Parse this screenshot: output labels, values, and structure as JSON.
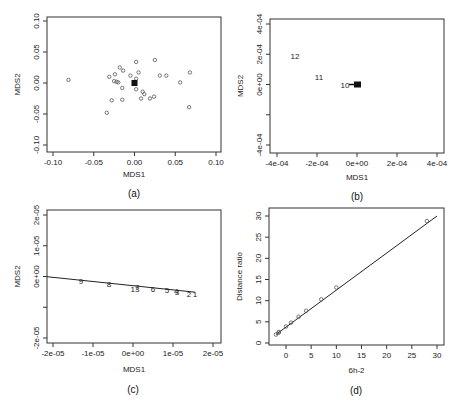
{
  "chart_data": [
    {
      "panel": "a",
      "type": "scatter",
      "caption": "(a)",
      "xlabel": "MDS1",
      "ylabel": "MDS2",
      "xlim": [
        -0.1,
        0.1
      ],
      "ylim": [
        -0.1,
        0.1
      ],
      "xticks": [
        "-0.10",
        "-0.05",
        "0.00",
        "0.05",
        "0.10"
      ],
      "yticks": [
        "-0.10",
        "-0.05",
        "0.00",
        "0.05",
        "0.10"
      ],
      "grid": false,
      "points": [
        [
          -0.081,
          0.005
        ],
        [
          -0.034,
          -0.048
        ],
        [
          -0.031,
          0.01
        ],
        [
          -0.028,
          -0.028
        ],
        [
          -0.025,
          0.003
        ],
        [
          -0.024,
          0.014
        ],
        [
          -0.022,
          0.002
        ],
        [
          -0.02,
          0.001
        ],
        [
          -0.018,
          0.025
        ],
        [
          -0.015,
          -0.008
        ],
        [
          -0.015,
          -0.027
        ],
        [
          -0.014,
          0.02
        ],
        [
          -0.005,
          0.012
        ],
        [
          0.002,
          0.034
        ],
        [
          0.002,
          0.007
        ],
        [
          0.002,
          -0.01
        ],
        [
          0.005,
          0.017
        ],
        [
          0.008,
          -0.025
        ],
        [
          0.01,
          -0.014
        ],
        [
          0.012,
          -0.018
        ],
        [
          0.019,
          -0.025
        ],
        [
          0.024,
          -0.022
        ],
        [
          0.025,
          0.037
        ],
        [
          0.031,
          0.012
        ],
        [
          0.039,
          0.012
        ],
        [
          0.056,
          0.001
        ],
        [
          0.068,
          0.017
        ],
        [
          0.067,
          -0.039
        ]
      ],
      "filled_cluster": [
        0.0,
        0.0
      ]
    },
    {
      "panel": "b",
      "type": "scatter",
      "caption": "(b)",
      "xlabel": "MDS1",
      "ylabel": "MDS2",
      "xlim": [
        -0.0004,
        0.0004
      ],
      "ylim": [
        -0.0004,
        0.0004
      ],
      "xticks": [
        "-4e-04",
        "-2e-04",
        "0e+00",
        "2e-04",
        "4e-04"
      ],
      "yticks": [
        "-4e-04",
        "2e-04",
        "0e+00",
        "2e-04",
        "4e-04"
      ],
      "ytick_labels_shown": [
        "-4e-04",
        "",
        "0e+00",
        "2e-04",
        "4e-04"
      ],
      "grid": false,
      "labeled_points": [
        {
          "label": "12",
          "x": -0.00031,
          "y": 0.00019
        },
        {
          "label": "11",
          "x": -0.00019,
          "y": 5e-05
        },
        {
          "label": "10",
          "x": -6e-05,
          "y": 0.0
        },
        {
          "label": "",
          "x": 0.0,
          "y": 0.0,
          "filled": true
        }
      ]
    },
    {
      "panel": "c",
      "type": "scatter",
      "caption": "(c)",
      "xlabel": "MDS1",
      "ylabel": "MDS2",
      "xlim": [
        -2e-05,
        2e-05
      ],
      "ylim": [
        -2e-05,
        2e-05
      ],
      "xticks": [
        "-2e-05",
        "-1e-05",
        "0e+00",
        "1e-05",
        "2e-05"
      ],
      "yticks": [
        "-2e-05",
        "",
        "0e+00",
        "1e-05",
        "2e-05"
      ],
      "grid": false,
      "fit_line": {
        "x": [
          -2.2e-05,
          1.55e-05
        ],
        "y": [
          0.0,
          -5.1e-06
        ]
      },
      "labeled_points": [
        {
          "label": "9",
          "x": -1.3e-05,
          "y": -1.6e-06
        },
        {
          "label": "8",
          "x": -6e-06,
          "y": -2.6e-06
        },
        {
          "label": "7",
          "x": 1e-06,
          "y": -3.4e-06
        },
        {
          "label": "13",
          "x": 5e-07,
          "y": -4.2e-06
        },
        {
          "label": "6",
          "x": 5e-06,
          "y": -4e-06
        },
        {
          "label": "5",
          "x": 8.5e-06,
          "y": -4.5e-06
        },
        {
          "label": "4",
          "x": 1.08e-05,
          "y": -4.8e-06
        },
        {
          "label": "3",
          "x": 1.1e-05,
          "y": -4.9e-06
        },
        {
          "label": "2",
          "x": 1.4e-05,
          "y": -5.6e-06
        },
        {
          "label": "1",
          "x": 1.55e-05,
          "y": -5.8e-06
        }
      ]
    },
    {
      "panel": "d",
      "type": "line",
      "caption": "(d)",
      "xlabel": "6h-2",
      "ylabel": "Distance ratio",
      "xlim": [
        -3,
        31
      ],
      "ylim": [
        0,
        31
      ],
      "xticks": [
        "0",
        "5",
        "10",
        "15",
        "20",
        "25",
        "30"
      ],
      "yticks": [
        "0",
        "5",
        "10",
        "15",
        "20",
        "25",
        "30"
      ],
      "grid": false,
      "line": {
        "x": [
          -2,
          30
        ],
        "y": [
          2,
          30
        ]
      },
      "points": [
        [
          -2.0,
          2.0
        ],
        [
          -1.5,
          2.4
        ],
        [
          -1.4,
          2.6
        ],
        [
          0.0,
          3.9
        ],
        [
          1.0,
          4.8
        ],
        [
          2.5,
          6.2
        ],
        [
          4.0,
          7.6
        ],
        [
          7.0,
          10.3
        ],
        [
          10.0,
          13.1
        ],
        [
          28.0,
          28.8
        ]
      ]
    }
  ]
}
